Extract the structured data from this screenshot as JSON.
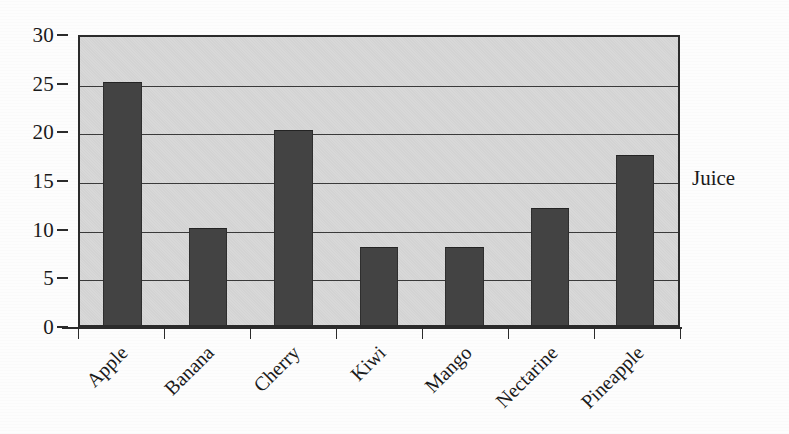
{
  "chart_data": {
    "type": "bar",
    "title": "",
    "subtitle": "",
    "xlabel": "",
    "ylabel": "",
    "categories": [
      "Apple",
      "Banana",
      "Cherry",
      "Kiwi",
      "Mango",
      "Nectarine",
      "Pineapple"
    ],
    "values": [
      25,
      10,
      20,
      8,
      8,
      12,
      17.5
    ],
    "series": [
      {
        "name": "Juice",
        "values": [
          25,
          10,
          20,
          8,
          8,
          12,
          17.5
        ]
      }
    ],
    "ylim": [
      0,
      30
    ],
    "ytick_labels": [
      "0",
      "5",
      "10",
      "15",
      "20",
      "25",
      "30"
    ],
    "ytick_values": [
      0,
      5,
      10,
      15,
      20,
      25,
      30
    ],
    "grid": true,
    "grid_axis": "y",
    "legend": "Juice",
    "legend_position": "right",
    "annotations": [],
    "xtick_label_rotation": "-45"
  },
  "labels": {
    "series_label": "Juice"
  },
  "colors": {
    "bar_fill": "#434343",
    "plot_background": "#d8d8d8",
    "page_background": "#fdfdfd",
    "axis": "#2b2b2b",
    "gridline": "#3a3a3a",
    "text": "#1a1a1a"
  }
}
